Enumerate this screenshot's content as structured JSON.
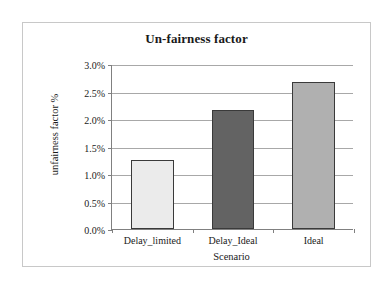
{
  "chart_data": {
    "type": "bar",
    "title": "Un-fairness factor",
    "xlabel": "Scenario",
    "ylabel": "unfairness factor %",
    "categories": [
      "Delay_limited",
      "Delay_Ideal",
      "Ideal"
    ],
    "values": [
      1.25,
      2.17,
      2.68
    ],
    "value_unit": "%",
    "ylim": [
      0.0,
      3.0
    ],
    "ytick_step": 0.5,
    "ytick_labels": [
      "0.0%",
      "0.5%",
      "1.0%",
      "1.5%",
      "2.0%",
      "2.5%",
      "3.0%"
    ],
    "ytick_values": [
      0.0,
      0.5,
      1.0,
      1.5,
      2.0,
      2.5,
      3.0
    ],
    "grid": true,
    "legend": false,
    "series": [
      {
        "name": "unfairness factor %",
        "points": [
          {
            "category": "Delay_limited",
            "value": 1.25,
            "fill": "#ebebeb"
          },
          {
            "category": "Delay_Ideal",
            "value": 2.17,
            "fill": "#636363"
          },
          {
            "category": "Ideal",
            "value": 2.68,
            "fill": "#b0b0b0"
          }
        ]
      }
    ],
    "bar_border_color": "#3a3a3a",
    "gridline_color": "#a8a8a8",
    "axis_color": "#808080",
    "plot_background": "#ffffff",
    "frame_border_color": "#c8c8c8"
  }
}
